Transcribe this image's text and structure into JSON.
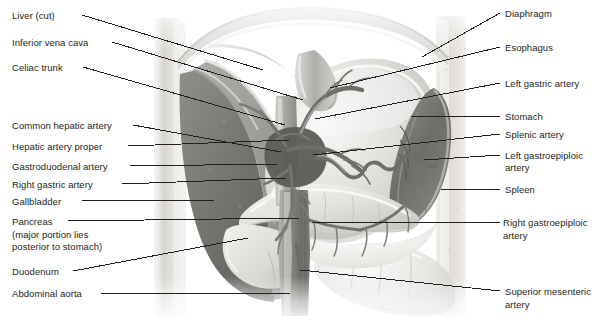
{
  "figure": {
    "width": 604,
    "height": 325,
    "background_color": "#ffffff",
    "leader_line_color": "#231f20",
    "text_color": "#231f20"
  },
  "labels_left": [
    {
      "id": "liver-cut",
      "text": "Liver (cut)",
      "x": 12,
      "y": 10,
      "line": [
        82,
        15,
        263,
        70
      ]
    },
    {
      "id": "inferior-vena-cava",
      "text": "Inferior vena cava",
      "x": 12,
      "y": 37,
      "line": [
        112,
        42,
        303,
        100
      ]
    },
    {
      "id": "celiac-trunk",
      "text": "Celiac trunk",
      "x": 12,
      "y": 62,
      "line": [
        83,
        67,
        285,
        125
      ]
    },
    {
      "id": "common-hepatic-artery",
      "text": "Common hepatic artery",
      "x": 12,
      "y": 120,
      "line": [
        133,
        125,
        281,
        152
      ]
    },
    {
      "id": "hepatic-artery-proper",
      "text": "Hepatic artery proper",
      "x": 12,
      "y": 141,
      "line": [
        128,
        146,
        289,
        140
      ]
    },
    {
      "id": "gastroduodenal-artery",
      "text": "Gastroduodenal artery",
      "x": 12,
      "y": 161,
      "line": [
        130,
        166,
        278,
        164
      ]
    },
    {
      "id": "right-gastric-artery",
      "text": "Right gastric artery",
      "x": 12,
      "y": 179,
      "line": [
        122,
        184,
        286,
        178
      ]
    },
    {
      "id": "gallbladder",
      "text": "Gallbladder",
      "x": 12,
      "y": 196,
      "line": [
        82,
        201,
        216,
        200
      ]
    },
    {
      "id": "pancreas",
      "text": "Pancreas",
      "x": 12,
      "y": 216,
      "line": [
        68,
        221,
        300,
        218
      ]
    },
    {
      "id": "pancreas-note-1",
      "text": "(major portion lies",
      "x": 12,
      "y": 229,
      "line": null
    },
    {
      "id": "pancreas-note-2",
      "text": "posterior to stomach)",
      "x": 12,
      "y": 241,
      "line": null
    },
    {
      "id": "duodenum",
      "text": "Duodenum",
      "x": 12,
      "y": 266,
      "line": [
        73,
        271,
        248,
        238
      ]
    },
    {
      "id": "abdominal-aorta",
      "text": "Abdominal aorta",
      "x": 12,
      "y": 288,
      "line": [
        101,
        293,
        290,
        293
      ]
    }
  ],
  "labels_right": [
    {
      "id": "diaphragm",
      "text": "Diaphragm",
      "x": 505,
      "y": 8,
      "line": [
        500,
        13,
        422,
        57
      ]
    },
    {
      "id": "esophagus",
      "text": "Esophagus",
      "x": 505,
      "y": 42,
      "line": [
        500,
        47,
        330,
        88
      ]
    },
    {
      "id": "left-gastric-artery",
      "text": "Left gastric artery",
      "x": 505,
      "y": 78,
      "line": [
        500,
        83,
        315,
        119
      ]
    },
    {
      "id": "stomach",
      "text": "Stomach",
      "x": 505,
      "y": 111,
      "line": [
        500,
        116,
        411,
        116
      ]
    },
    {
      "id": "splenic-artery",
      "text": "Splenic artery",
      "x": 505,
      "y": 129,
      "line": [
        500,
        134,
        313,
        155
      ]
    },
    {
      "id": "left-gastroepiploic-1",
      "text": "Left gastroepiploic",
      "x": 505,
      "y": 150,
      "line": [
        500,
        155,
        424,
        160
      ]
    },
    {
      "id": "left-gastroepiploic-2",
      "text": "artery",
      "x": 505,
      "y": 162,
      "line": null
    },
    {
      "id": "spleen",
      "text": "Spleen",
      "x": 505,
      "y": 184,
      "line": [
        500,
        189,
        441,
        189
      ]
    },
    {
      "id": "right-gastroepiploic-1",
      "text": "Right gastroepiploic",
      "x": 503,
      "y": 217,
      "line": [
        500,
        222,
        312,
        222
      ]
    },
    {
      "id": "right-gastroepiploic-2",
      "text": "artery",
      "x": 503,
      "y": 230,
      "line": null
    },
    {
      "id": "superior-mesenteric-1",
      "text": "Superior mesenteric",
      "x": 505,
      "y": 286,
      "line": [
        500,
        291,
        300,
        270
      ]
    },
    {
      "id": "superior-mesenteric-2",
      "text": "artery",
      "x": 505,
      "y": 299,
      "line": null
    }
  ],
  "illustration": {
    "name": "abdominal-viscera-illustration",
    "description": "Grayscale anatomical drawing: liver (cut), stomach, spleen, pancreas, duodenum and the celiac trunk with its branches",
    "panel": {
      "x": 148,
      "y": 0,
      "width": 330,
      "height": 325
    },
    "structures": [
      "liver-cut",
      "inferior-vena-cava",
      "abdominal-aorta",
      "celiac-trunk",
      "common-hepatic-artery",
      "hepatic-artery-proper",
      "gastroduodenal-artery",
      "right-gastric-artery",
      "left-gastric-artery",
      "splenic-artery",
      "left-gastroepiploic-artery",
      "right-gastroepiploic-artery",
      "superior-mesenteric-artery",
      "stomach",
      "spleen",
      "pancreas",
      "duodenum",
      "gallbladder",
      "esophagus",
      "diaphragm"
    ]
  }
}
